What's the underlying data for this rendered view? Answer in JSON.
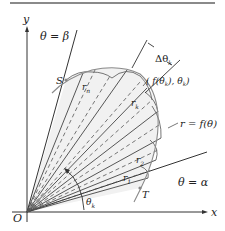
{
  "figure": {
    "labels": {
      "y_axis": "y",
      "x_axis": "x",
      "origin": "O",
      "beta_ray": "θ = β",
      "alpha_ray": "θ = α",
      "start_point": "S",
      "end_point": "T",
      "r_n": "r",
      "r_n_sub": "n",
      "r_k": "r",
      "r_k_sub": "k",
      "r_2": "r",
      "r_2_sub": "2",
      "r_1": "r",
      "r_1_sub": "1",
      "delta_theta": "Δθ",
      "delta_theta_sub": "k",
      "point_k": "( f(θ",
      "point_k_mid": "), θ",
      "point_k_end": ")",
      "point_k_sub": "k",
      "curve": "r = f(θ)",
      "theta_k": "θ",
      "theta_k_sub": "k"
    },
    "colors": {
      "ink": "#333333",
      "curve": "#8a8a8a",
      "sector_fill": "#f1f1f1",
      "frame": "#8a8a8a"
    }
  }
}
